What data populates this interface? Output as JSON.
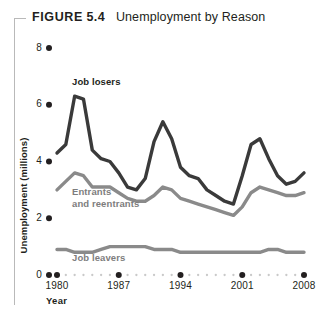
{
  "figure": {
    "label": "FIGURE",
    "number": "5.4",
    "caption": "Unemployment by Reason"
  },
  "colors": {
    "job_losers": "#3a3a3a",
    "entrants": "#8a8a8a",
    "job_leavers": "#8a8a8a",
    "axis_dots": "#231f20",
    "minor_dots": "#c9c9c9",
    "frame_rule": "#b9b9b9"
  },
  "annotations": {
    "job_losers": "Job losers",
    "entrants": "Entrants\nand reentrants",
    "job_leavers": "Job leavers"
  },
  "chart_data": {
    "type": "line",
    "title": "Unemployment by Reason",
    "xlabel": "Year",
    "ylabel": "Unemployment (millions)",
    "xlim": [
      1980,
      2008
    ],
    "ylim": [
      0,
      8
    ],
    "yticks": [
      0,
      2,
      4,
      6,
      8
    ],
    "xticks": [
      1980,
      1987,
      1994,
      2001,
      2008
    ],
    "xtick_labels": [
      "1980",
      "1987",
      "1994",
      "2001",
      "2008"
    ],
    "ytick_labels": [
      "0",
      "2",
      "4",
      "6",
      "8"
    ],
    "grid": false,
    "legend": "inline-annotations",
    "x": [
      1980,
      1981,
      1982,
      1983,
      1984,
      1985,
      1986,
      1987,
      1988,
      1989,
      1990,
      1991,
      1992,
      1993,
      1994,
      1995,
      1996,
      1997,
      1998,
      1999,
      2000,
      2001,
      2002,
      2003,
      2004,
      2005,
      2006,
      2007,
      2008
    ],
    "series": [
      {
        "name": "Job losers",
        "color": "#3a3a3a",
        "values": [
          4.3,
          4.6,
          6.3,
          6.2,
          4.4,
          4.1,
          4.0,
          3.6,
          3.1,
          3.0,
          3.4,
          4.7,
          5.4,
          4.8,
          3.8,
          3.5,
          3.4,
          3.0,
          2.8,
          2.6,
          2.5,
          3.5,
          4.6,
          4.8,
          4.1,
          3.5,
          3.2,
          3.3,
          3.6
        ]
      },
      {
        "name": "Entrants and reentrants",
        "color": "#8a8a8a",
        "values": [
          3.0,
          3.3,
          3.6,
          3.5,
          3.1,
          3.1,
          3.1,
          2.9,
          2.7,
          2.6,
          2.6,
          2.8,
          3.1,
          3.0,
          2.7,
          2.6,
          2.5,
          2.4,
          2.3,
          2.2,
          2.1,
          2.4,
          2.9,
          3.1,
          3.0,
          2.9,
          2.8,
          2.8,
          2.9
        ]
      },
      {
        "name": "Job leavers",
        "color": "#8a8a8a",
        "values": [
          0.9,
          0.9,
          0.8,
          0.8,
          0.8,
          0.9,
          1.0,
          1.0,
          1.0,
          1.0,
          1.0,
          0.9,
          0.9,
          0.9,
          0.8,
          0.8,
          0.8,
          0.8,
          0.8,
          0.8,
          0.8,
          0.8,
          0.8,
          0.8,
          0.9,
          0.9,
          0.8,
          0.8,
          0.8
        ]
      }
    ]
  }
}
